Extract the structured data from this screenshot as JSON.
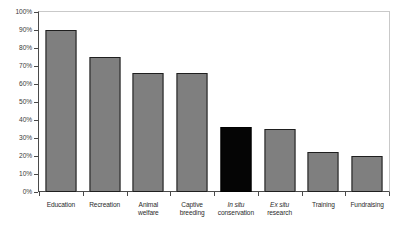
{
  "chart_data": {
    "type": "bar",
    "title": "",
    "subtitle": "",
    "xlabel": "",
    "ylabel": "",
    "ylim": [
      0,
      100
    ],
    "grid": false,
    "legend": null,
    "orientation": "vertical",
    "value_unit": "%",
    "categories": [
      "Education",
      "Recreation",
      "Animal welfare",
      "Captive breeding",
      "In situ conservation",
      "Ex situ research",
      "Training",
      "Fundraising"
    ],
    "values": [
      90,
      75,
      66,
      66,
      36,
      35,
      22,
      20
    ],
    "y_ticks": [
      0,
      10,
      20,
      30,
      40,
      50,
      60,
      70,
      80,
      90,
      100
    ],
    "y_tick_labels": [
      "0%",
      "10%",
      "20%",
      "30%",
      "40%",
      "50%",
      "60%",
      "70%",
      "80%",
      "90%",
      "100%"
    ],
    "bars": [
      {
        "label_line1": "Education",
        "label_line2": "",
        "italic_line1": false,
        "italic_line2": false,
        "value": 90,
        "color": "#7f7f7f",
        "highlight": false
      },
      {
        "label_line1": "Recreation",
        "label_line2": "",
        "italic_line1": false,
        "italic_line2": false,
        "value": 75,
        "color": "#7f7f7f",
        "highlight": false
      },
      {
        "label_line1": "Animal",
        "label_line2": "welfare",
        "italic_line1": false,
        "italic_line2": false,
        "value": 66,
        "color": "#7f7f7f",
        "highlight": false
      },
      {
        "label_line1": "Captive",
        "label_line2": "breeding",
        "italic_line1": false,
        "italic_line2": false,
        "value": 66,
        "color": "#7f7f7f",
        "highlight": false
      },
      {
        "label_line1": "In situ",
        "label_line2": "conservation",
        "italic_line1": true,
        "italic_line2": false,
        "value": 36,
        "color": "#050505",
        "highlight": true
      },
      {
        "label_line1": "Ex situ",
        "label_line2": "research",
        "italic_line1": true,
        "italic_line2": false,
        "value": 35,
        "color": "#7f7f7f",
        "highlight": false
      },
      {
        "label_line1": "Training",
        "label_line2": "",
        "italic_line1": false,
        "italic_line2": false,
        "value": 22,
        "color": "#7f7f7f",
        "highlight": false
      },
      {
        "label_line1": "Fundraising",
        "label_line2": "",
        "italic_line1": false,
        "italic_line2": false,
        "value": 20,
        "color": "#7f7f7f",
        "highlight": false
      }
    ],
    "colors": {
      "bar_fill": "#7f7f7f",
      "bar_highlight_fill": "#050505",
      "bar_border": "#1f1f1f",
      "axis": "#4a4a4a",
      "frame_light": "#c9c9c9",
      "text": "#2b2b2b",
      "background": "#ffffff"
    }
  }
}
